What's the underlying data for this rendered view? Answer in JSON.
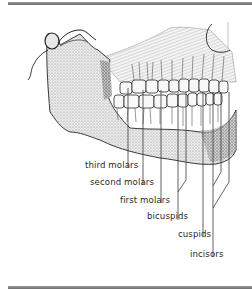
{
  "figure": {
    "labels": [
      {
        "id": "third-molars",
        "text": "third molars",
        "x": 85,
        "y": 172
      },
      {
        "id": "second-molars",
        "text": "second molars",
        "x": 90,
        "y": 189
      },
      {
        "id": "first-molars",
        "text": "first molars",
        "x": 120,
        "y": 207
      },
      {
        "id": "bicuspids",
        "text": "bicuspids",
        "x": 147,
        "y": 223
      },
      {
        "id": "cuspids",
        "text": "cuspids",
        "x": 178,
        "y": 241
      },
      {
        "id": "incisors",
        "text": "incisors",
        "x": 190,
        "y": 261
      }
    ]
  },
  "colors": {
    "rule": "#7a7a7a",
    "ink": "#2a2a2a",
    "bone_shade": "#8c8c8c",
    "background": "#ffffff"
  }
}
